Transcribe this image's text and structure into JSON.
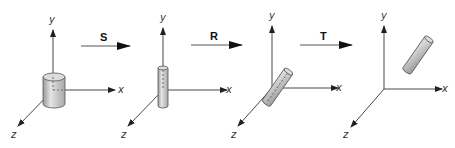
{
  "figure": {
    "panels": [
      {
        "id": "original",
        "axis_labels": {
          "x": "x",
          "y": "y",
          "z": "z"
        }
      },
      {
        "id": "scaled",
        "axis_labels": {
          "x": "x",
          "y": "y",
          "z": "z"
        }
      },
      {
        "id": "rotated",
        "axis_labels": {
          "x": "x",
          "y": "y",
          "z": "z"
        }
      },
      {
        "id": "translated",
        "axis_labels": {
          "x": "x",
          "y": "y",
          "z": "z"
        }
      }
    ],
    "transforms": [
      {
        "label": "S",
        "meaning": "scale"
      },
      {
        "label": "R",
        "meaning": "rotate"
      },
      {
        "label": "T",
        "meaning": "translate"
      }
    ],
    "colors": {
      "axis": "#333333",
      "cylinder_fill": "#cfcfcf",
      "cylinder_edge": "#555555"
    }
  }
}
